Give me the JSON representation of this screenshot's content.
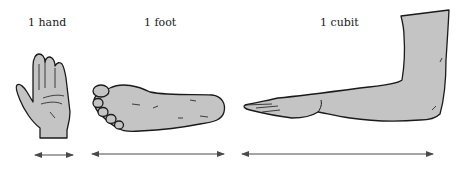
{
  "figure": {
    "units": [
      {
        "label": "1 hand",
        "part": "hand",
        "measure": "width of palm"
      },
      {
        "label": "1 foot",
        "part": "foot",
        "measure": "heel to toe"
      },
      {
        "label": "1 cubit",
        "part": "forearm",
        "measure": "elbow to fingertip"
      }
    ]
  },
  "colors": {
    "skin_fill": "#c4c4c4",
    "outline": "#1a1a1a",
    "arrow": "#555555",
    "background": "#ffffff"
  }
}
